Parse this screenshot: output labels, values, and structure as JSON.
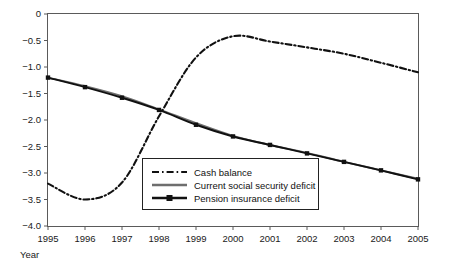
{
  "chart_data": {
    "type": "line",
    "title": "",
    "xlabel": "Year",
    "ylabel": "",
    "xlim": [
      1995,
      2005
    ],
    "ylim": [
      -4.0,
      0
    ],
    "grid": false,
    "legend_position": "center-bottom-inside",
    "x": [
      1995,
      1996,
      1997,
      1998,
      1999,
      2000,
      2001,
      2002,
      2003,
      2004,
      2005
    ],
    "xticklabels": [
      "1995",
      "1996",
      "1997",
      "1998",
      "1999",
      "2000",
      "2001",
      "2002",
      "2003",
      "2004",
      "2005"
    ],
    "yticks": [
      0,
      -0.5,
      -1.0,
      -1.5,
      -2.0,
      -2.5,
      -3.0,
      -3.5,
      -4.0
    ],
    "yticklabels": [
      "0",
      "-0.5",
      "-1.0",
      "-1.5",
      "-2.0",
      "-2.5",
      "-3.0",
      "-3.5",
      "-4.0"
    ],
    "series": [
      {
        "name": "Cash balance",
        "style": "dash-dot",
        "color": "#111111",
        "marker": "none",
        "values": [
          -3.2,
          -3.5,
          -3.18,
          -1.93,
          -0.82,
          -0.42,
          -0.52,
          -0.63,
          -0.75,
          -0.92,
          -1.1
        ]
      },
      {
        "name": "Current social security deficit",
        "style": "solid",
        "color": "#6e6e6e",
        "marker": "none",
        "values": [
          -1.2,
          -1.36,
          -1.55,
          -1.8,
          -2.06,
          -2.3,
          -2.47,
          -2.62,
          -2.79,
          -2.95,
          -3.11
        ]
      },
      {
        "name": "Pension insurance deficit",
        "style": "solid",
        "color": "#111111",
        "marker": "square",
        "values": [
          -1.2,
          -1.38,
          -1.58,
          -1.81,
          -2.09,
          -2.31,
          -2.47,
          -2.63,
          -2.79,
          -2.95,
          -3.12
        ]
      }
    ]
  },
  "legend": {
    "entries": [
      {
        "label": "Cash balance"
      },
      {
        "label": "Current social security deficit"
      },
      {
        "label": "Pension insurance deficit"
      }
    ]
  },
  "axes": {
    "x_title": "Year"
  }
}
